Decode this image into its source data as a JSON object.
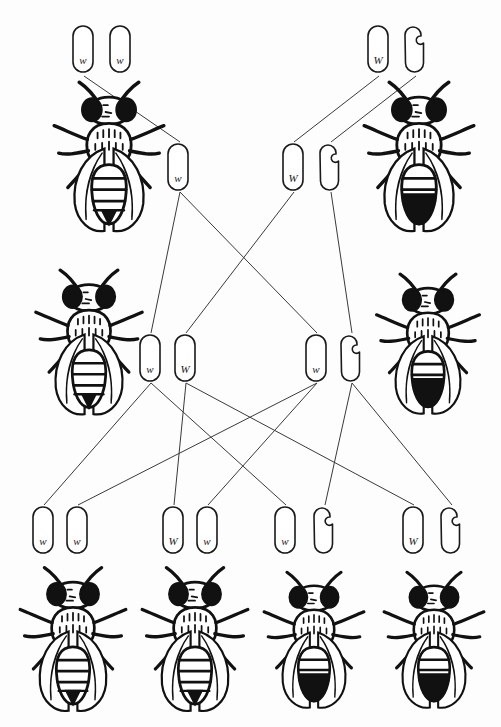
{
  "diagram": {
    "background_color": "#fdfdfd",
    "line_color": "#3a3a3a",
    "chromosome_outline_color": "#1a1a1a",
    "fly_color": "#111111",
    "width": 501,
    "height": 727
  },
  "generations": [
    {
      "name": "parental",
      "label": "P",
      "flies": [
        {
          "id": "p-female",
          "sex": "female",
          "eye": "white",
          "x": 48,
          "y": 80,
          "w": 122,
          "h": 160
        },
        {
          "id": "p-male",
          "sex": "male",
          "eye": "red",
          "x": 358,
          "y": 80,
          "w": 122,
          "h": 160
        }
      ],
      "chromosome_groups": [
        {
          "id": "p-female-genotype",
          "sex": "female",
          "x": 70,
          "y": 24,
          "chromosomes": [
            {
              "type": "X",
              "allele": "w",
              "x": 70,
              "y": 24
            },
            {
              "type": "X",
              "allele": "w",
              "x": 107,
              "y": 24
            }
          ]
        },
        {
          "id": "p-male-genotype",
          "sex": "male",
          "x": 365,
          "y": 24,
          "chromosomes": [
            {
              "type": "X",
              "allele": "W",
              "x": 365,
              "y": 24
            },
            {
              "type": "Y",
              "allele": "",
              "x": 402,
              "y": 24
            }
          ]
        }
      ]
    },
    {
      "name": "parental-gametes",
      "label": "gametes",
      "flies": [],
      "chromosome_groups": [
        {
          "id": "p-female-gamete",
          "sex": "female",
          "x": 165,
          "y": 142,
          "chromosomes": [
            {
              "type": "X",
              "allele": "w",
              "x": 165,
              "y": 142
            }
          ]
        },
        {
          "id": "p-male-gametes",
          "sex": "male",
          "x": 280,
          "y": 142,
          "chromosomes": [
            {
              "type": "X",
              "allele": "W",
              "x": 280,
              "y": 142
            },
            {
              "type": "Y",
              "allele": "",
              "x": 317,
              "y": 142
            }
          ]
        }
      ]
    },
    {
      "name": "f1",
      "label": "F1",
      "flies": [
        {
          "id": "f1-female",
          "sex": "female",
          "eye": "red",
          "x": 30,
          "y": 268,
          "w": 118,
          "h": 155
        },
        {
          "id": "f1-male",
          "sex": "male",
          "eye": "white",
          "x": 372,
          "y": 272,
          "w": 112,
          "h": 150
        }
      ],
      "chromosome_groups": [
        {
          "id": "f1-female-genotype",
          "sex": "female",
          "x": 137,
          "y": 333,
          "chromosomes": [
            {
              "type": "X",
              "allele": "w",
              "x": 137,
              "y": 333
            },
            {
              "type": "X",
              "allele": "W",
              "x": 172,
              "y": 333
            }
          ]
        },
        {
          "id": "f1-male-genotype",
          "sex": "male",
          "x": 303,
          "y": 333,
          "chromosomes": [
            {
              "type": "X",
              "allele": "w",
              "x": 303,
              "y": 333
            },
            {
              "type": "Y",
              "allele": "",
              "x": 338,
              "y": 333
            }
          ]
        }
      ]
    },
    {
      "name": "f2",
      "label": "F2",
      "flies": [
        {
          "id": "f2-fly-1",
          "sex": "female",
          "eye": "white",
          "x": 18,
          "y": 565,
          "w": 110,
          "h": 155
        },
        {
          "id": "f2-fly-2",
          "sex": "female",
          "eye": "red",
          "x": 140,
          "y": 565,
          "w": 110,
          "h": 155
        },
        {
          "id": "f2-fly-3",
          "sex": "male",
          "eye": "white",
          "x": 262,
          "y": 568,
          "w": 104,
          "h": 150
        },
        {
          "id": "f2-fly-4",
          "sex": "male",
          "eye": "red",
          "x": 382,
          "y": 568,
          "w": 104,
          "h": 150
        }
      ],
      "chromosome_groups": [
        {
          "id": "f2-genotype-1",
          "sex": "female",
          "x": 30,
          "y": 505,
          "chromosomes": [
            {
              "type": "X",
              "allele": "w",
              "x": 30,
              "y": 505
            },
            {
              "type": "X",
              "allele": "w",
              "x": 64,
              "y": 505
            }
          ]
        },
        {
          "id": "f2-genotype-2",
          "sex": "female",
          "x": 160,
          "y": 505,
          "chromosomes": [
            {
              "type": "X",
              "allele": "W",
              "x": 160,
              "y": 505
            },
            {
              "type": "X",
              "allele": "w",
              "x": 194,
              "y": 505
            }
          ]
        },
        {
          "id": "f2-genotype-3",
          "sex": "male",
          "x": 272,
          "y": 505,
          "chromosomes": [
            {
              "type": "X",
              "allele": "w",
              "x": 272,
              "y": 505
            },
            {
              "type": "Y",
              "allele": "",
              "x": 311,
              "y": 505
            }
          ]
        },
        {
          "id": "f2-genotype-4",
          "sex": "male",
          "x": 400,
          "y": 505,
          "chromosomes": [
            {
              "type": "X",
              "allele": "W",
              "x": 400,
              "y": 505
            },
            {
              "type": "Y",
              "allele": "",
              "x": 438,
              "y": 505
            }
          ]
        }
      ]
    }
  ],
  "connectors": [
    {
      "id": "c1",
      "from": "p-female-left-X",
      "x1": 84,
      "y1": 76,
      "x2": 180,
      "y2": 142
    },
    {
      "id": "c2",
      "from": "p-male-X",
      "x1": 379,
      "y1": 76,
      "x2": 294,
      "y2": 142
    },
    {
      "id": "c3",
      "from": "p-male-Y",
      "x1": 416,
      "y1": 76,
      "x2": 331,
      "y2": 142
    },
    {
      "id": "c4",
      "from": "gamete-w-to-f1-female",
      "x1": 180,
      "y1": 192,
      "x2": 151,
      "y2": 333
    },
    {
      "id": "c5",
      "from": "gamete-w-to-f1-male",
      "x1": 180,
      "y1": 192,
      "x2": 317,
      "y2": 333
    },
    {
      "id": "c6",
      "from": "gamete-W-to-f1-female",
      "x1": 294,
      "y1": 192,
      "x2": 186,
      "y2": 333
    },
    {
      "id": "c7",
      "from": "gamete-Y-to-f1-male",
      "x1": 331,
      "y1": 192,
      "x2": 352,
      "y2": 333
    },
    {
      "id": "c8",
      "from": "f1-female-w-to-f2-1",
      "x1": 151,
      "y1": 383,
      "x2": 44,
      "y2": 505
    },
    {
      "id": "c9",
      "from": "f1-female-w-to-f2-3",
      "x1": 151,
      "y1": 383,
      "x2": 286,
      "y2": 505
    },
    {
      "id": "c10",
      "from": "f1-female-W-to-f2-2",
      "x1": 186,
      "y1": 383,
      "x2": 174,
      "y2": 505
    },
    {
      "id": "c11",
      "from": "f1-female-W-to-f2-4",
      "x1": 186,
      "y1": 383,
      "x2": 414,
      "y2": 505
    },
    {
      "id": "c12",
      "from": "f1-male-w-to-f2-1",
      "x1": 317,
      "y1": 383,
      "x2": 78,
      "y2": 505
    },
    {
      "id": "c13",
      "from": "f1-male-w-to-f2-2",
      "x1": 317,
      "y1": 383,
      "x2": 208,
      "y2": 505
    },
    {
      "id": "c14",
      "from": "f1-male-Y-to-f2-3",
      "x1": 352,
      "y1": 383,
      "x2": 325,
      "y2": 505
    },
    {
      "id": "c15",
      "from": "f1-male-Y-to-f2-4",
      "x1": 352,
      "y1": 383,
      "x2": 452,
      "y2": 505
    }
  ]
}
